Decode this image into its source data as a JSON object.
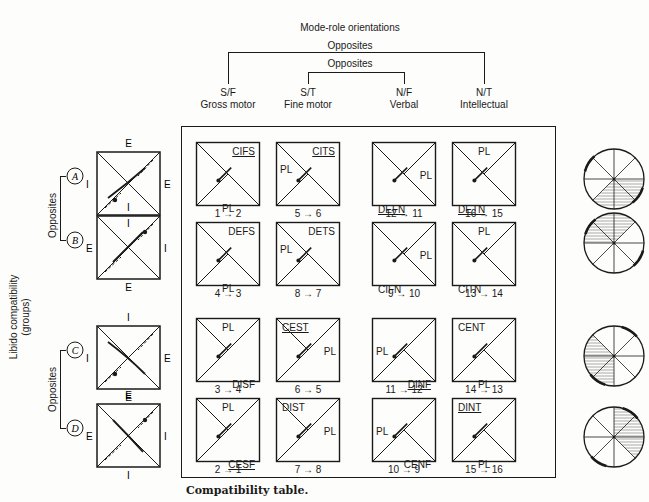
{
  "header": {
    "title": "Mode-role orientations",
    "outer_bracket_label": "Opposites",
    "inner_bracket_label": "Opposites",
    "columns": [
      {
        "code": "S/F",
        "name": "Gross motor"
      },
      {
        "code": "S/T",
        "name": "Fine motor"
      },
      {
        "code": "N/F",
        "name": "Verbal"
      },
      {
        "code": "N/T",
        "name": "Intellectual"
      }
    ]
  },
  "left_axis": {
    "title_line1": "Libido compatibility",
    "title_line2": "(groups)",
    "opposites_top": "Opposites",
    "opposites_bottom": "Opposites",
    "groups": [
      {
        "id": "A",
        "left": "I",
        "right": "E",
        "top": "E",
        "bottom": "I"
      },
      {
        "id": "B",
        "left": "E",
        "right": "I",
        "top": "I",
        "bottom": "E"
      },
      {
        "id": "C",
        "left": "I",
        "right": "E",
        "top": "I",
        "bottom": "E"
      },
      {
        "id": "D",
        "left": "E",
        "right": "I",
        "top": "E",
        "bottom": "I"
      }
    ]
  },
  "table": {
    "rows": [
      [
        {
          "code": "CIFS",
          "underlined": true,
          "pl": "PL",
          "transition": "1 → 2"
        },
        {
          "code": "CITS",
          "underlined": true,
          "pl": "PL",
          "transition": "5 → 6"
        },
        {
          "code": "DEFN",
          "underlined": true,
          "pl": "PL",
          "transition": "12 → 11"
        },
        {
          "code": "DETN",
          "underlined": true,
          "pl": "PL",
          "transition": "16 → 15"
        }
      ],
      [
        {
          "code": "DEFS",
          "underlined": false,
          "pl": "PL",
          "transition": "4 → 3"
        },
        {
          "code": "DETS",
          "underlined": false,
          "pl": "PL",
          "transition": "8 → 7"
        },
        {
          "code": "CIFN",
          "underlined": false,
          "pl": "PL",
          "transition": "9 → 10"
        },
        {
          "code": "CITN",
          "underlined": false,
          "pl": "PL",
          "transition": "13 → 14"
        }
      ],
      [
        {
          "code": "DISF",
          "underlined": false,
          "pl": "PL",
          "transition": "3 → 4"
        },
        {
          "code": "CEST",
          "underlined": true,
          "pl": "PL",
          "transition": "6 → 5"
        },
        {
          "code": "DINF",
          "underlined": true,
          "pl": "PL",
          "transition": "11 → 12"
        },
        {
          "code": "CENT",
          "underlined": false,
          "pl": "PL",
          "transition": "14 → 13"
        }
      ],
      [
        {
          "code": "CESF",
          "underlined": true,
          "pl": "PL",
          "transition": "2 → 1"
        },
        {
          "code": "DIST",
          "underlined": false,
          "pl": "PL",
          "transition": "7 → 8"
        },
        {
          "code": "CENF",
          "underlined": false,
          "pl": "PL",
          "transition": "10 → 9"
        },
        {
          "code": "DINT",
          "underlined": true,
          "pl": "PL",
          "transition": "15 → 16"
        }
      ]
    ]
  },
  "caption": "Compatibility table."
}
